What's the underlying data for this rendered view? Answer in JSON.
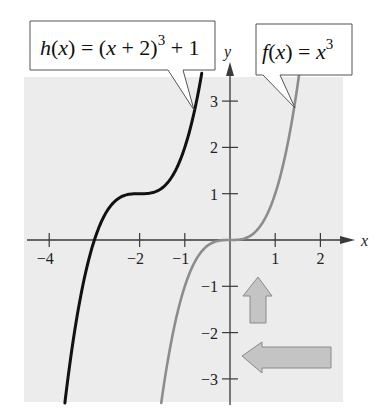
{
  "chart_data": {
    "type": "line",
    "title": "",
    "xlabel": "x",
    "ylabel": "y",
    "xlim": [
      -4.3,
      2.5
    ],
    "ylim": [
      -3.5,
      3.6
    ],
    "grid": false,
    "x_ticks": [
      -4,
      -2,
      -1,
      1,
      2
    ],
    "x_tick_labels": [
      "−4",
      "−2",
      "−1",
      "1",
      "2"
    ],
    "y_ticks": [
      -3,
      -2,
      -1,
      1,
      2,
      3
    ],
    "y_tick_labels": [
      "−3",
      "−2",
      "−1",
      "1",
      "2",
      "3"
    ],
    "series": [
      {
        "name": "h(x) = (x + 2)^3 + 1",
        "color": "#111111",
        "shift_x": -2,
        "shift_y": 1,
        "x": [
          -3.6,
          -3.0,
          -2.5,
          -2.0,
          -1.5,
          -1.0,
          -0.85
        ],
        "y": [
          -3.1,
          0,
          0.875,
          1,
          1.125,
          2,
          2.52
        ]
      },
      {
        "name": "f(x) = x^3",
        "color": "#8c8c8c",
        "shift_x": 0,
        "shift_y": 0,
        "x": [
          -1.5,
          -1,
          -0.5,
          0,
          0.5,
          1,
          1.52
        ],
        "y": [
          -3.375,
          -1,
          -0.125,
          0,
          0.125,
          1,
          3.5
        ]
      }
    ],
    "annotations": [
      {
        "type": "callout",
        "text": "h(x) = (x + 2)^3 + 1",
        "points_to": "h"
      },
      {
        "type": "callout",
        "text": "f(x) = x^3",
        "points_to": "f"
      },
      {
        "type": "arrow",
        "direction": "up",
        "meaning": "vertical shift up 1"
      },
      {
        "type": "arrow",
        "direction": "left",
        "meaning": "horizontal shift left 2"
      }
    ]
  },
  "labels": {
    "h_callout": {
      "fn": "h",
      "arg": "x",
      "eq": "=",
      "inner": "(x + 2)",
      "exp": "3",
      "tail": "+ 1"
    },
    "f_callout": {
      "fn": "f",
      "arg": "x",
      "eq": "=",
      "base": "x",
      "exp": "3"
    },
    "x_axis": "x",
    "y_axis": "y"
  },
  "colors": {
    "panel": "#ececec",
    "axis": "#3a3a3a",
    "h_curve": "#111111",
    "f_curve": "#8c8c8c",
    "arrow_fill": "#c4c4c4",
    "arrow_stroke": "#8a8a8a"
  }
}
